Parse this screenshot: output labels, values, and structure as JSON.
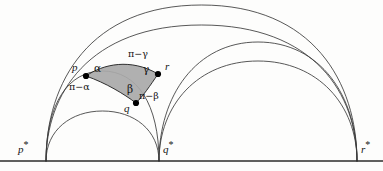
{
  "figure": {
    "type": "hyperbolic-geometry-diagram",
    "background_color": "#fdfdfc",
    "stroke_color": "#3a3a3a",
    "baseline_color": "#2b2b2b",
    "shade_fill": "#a9a9a9",
    "shade_stroke": "#1d1d1d",
    "vertex_dot_color": "#000000"
  },
  "baseline": {
    "name": "boundary-line",
    "y": 161,
    "x_start": 0,
    "x_end": 383
  },
  "vertices": [
    {
      "id": "p",
      "label": "p",
      "x": 86,
      "y": 76,
      "label_x": 72,
      "label_y": 68
    },
    {
      "id": "q",
      "label": "q",
      "x": 136,
      "y": 103,
      "label_x": 124,
      "label_y": 108
    },
    {
      "id": "r",
      "label": "r",
      "x": 158,
      "y": 74,
      "label_x": 166,
      "label_y": 66
    }
  ],
  "ideal_points": [
    {
      "id": "p_star",
      "label": "p",
      "star": "*",
      "x": 46,
      "y": 161,
      "label_x": 20,
      "label_y": 143
    },
    {
      "id": "q_star",
      "label": "q",
      "star": "*",
      "x": 159,
      "y": 161,
      "label_x": 164,
      "label_y": 143
    },
    {
      "id": "r_star",
      "label": "r",
      "star": "*",
      "x": 357,
      "y": 161,
      "label_x": 362,
      "label_y": 143
    }
  ],
  "angles": [
    {
      "id": "alpha",
      "label": "α",
      "at": "p",
      "x": 97,
      "y": 70
    },
    {
      "id": "beta",
      "label": "β",
      "at": "q",
      "x": 130,
      "y": 90
    },
    {
      "id": "gamma",
      "label": "γ",
      "at": "r",
      "x": 146,
      "y": 70
    },
    {
      "id": "pi-alpha",
      "label": "π−α",
      "at": "p",
      "x": 73,
      "y": 85
    },
    {
      "id": "pi-beta",
      "label": "π−β",
      "at": "q",
      "x": 140,
      "y": 95
    },
    {
      "id": "pi-gamma",
      "label": "π−γ",
      "at": "r",
      "x": 131,
      "y": 54
    }
  ],
  "geodesics": [
    {
      "id": "arc-pstar-rstar-outer",
      "from": "p_star",
      "to": "r_star",
      "description": "largest semicircle, outermost arc from p* to r*",
      "apex_y": 5
    },
    {
      "id": "arc-pstar-qstar-through-p-q",
      "from": "p_star",
      "to": "q_star",
      "description": "geodesic through vertices p and q",
      "apex_y": 71
    },
    {
      "id": "arc-pstar-qstar-small",
      "from": "p_star",
      "to": "q_star",
      "description": "small geodesic below q",
      "apex_y": 111
    },
    {
      "id": "arc-qstar-rstar-through-r",
      "from": "q_star",
      "to": "r_star",
      "description": "geodesic from q* to r* passing through r",
      "apex_y": 42
    },
    {
      "id": "arc-qstar-rstar-inner",
      "from": "q_star",
      "to": "r_star",
      "description": "inner geodesic from q* to r*",
      "apex_y": 61
    },
    {
      "id": "arc-pstar-rstar-through-p-r",
      "from": "p_star",
      "to": "r_star",
      "description": "geodesic through p and r forming the top edge of the triangle",
      "apex_y": 25
    }
  ],
  "triangle": {
    "id": "hyperbolic-triangle-pqr",
    "vertices": [
      "p",
      "q",
      "r"
    ],
    "fill": "#a9a9a9",
    "description": "Shaded hyperbolic triangle with curved (geodesic) sides"
  }
}
